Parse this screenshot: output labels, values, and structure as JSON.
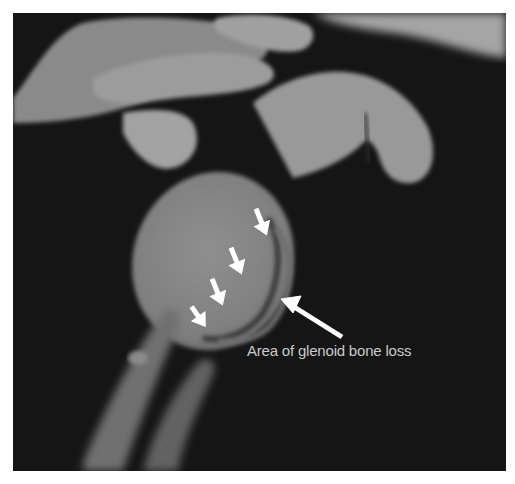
{
  "figure": {
    "type": "3D CT reconstruction of shoulder (sagittal view of glenoid)",
    "annotation": {
      "label": "Area of glenoid bone loss",
      "arrow_color": "#ffffff",
      "text_color": "#c9c9c9"
    },
    "small_arrows_count": 4,
    "colors": {
      "background": "#151515",
      "bone_light": "#9a9a9a",
      "bone_mid": "#7e7e7e",
      "border": "#ffffff"
    }
  }
}
